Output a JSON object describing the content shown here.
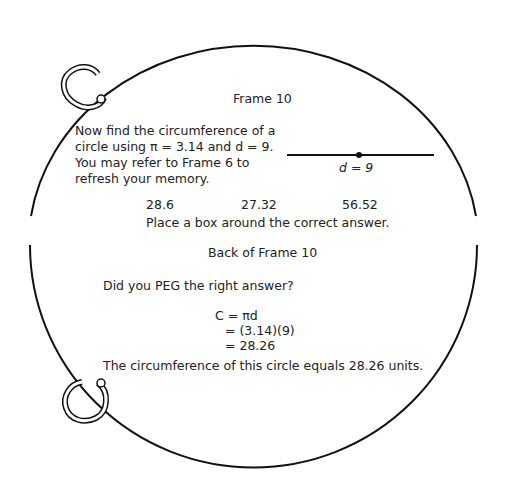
{
  "front": {
    "title": "Frame 10",
    "prompt_lines": [
      "Now find the circumference of a",
      "circle using π = 3.14 and d = 9.",
      "You may refer to Frame 6 to",
      "refresh your memory."
    ],
    "diagram_label": "d = 9",
    "choices": [
      "28.6",
      "27.32",
      "56.52"
    ],
    "instruction": "Place a box around the correct answer."
  },
  "back": {
    "title": "Back of Frame 10",
    "question": "Did you PEG the right answer?",
    "work": [
      "C = πd",
      "= (3.14)(9)",
      "= 28.26"
    ],
    "conclusion": "The circumference of this circle equals 28.26 units."
  }
}
